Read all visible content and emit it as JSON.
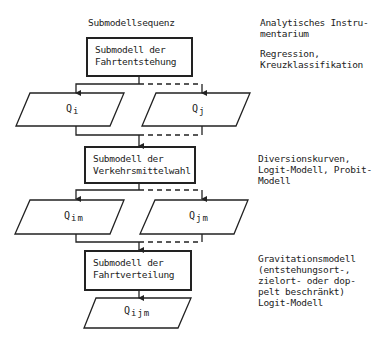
{
  "headers": {
    "left": "Submodellsequenz",
    "right": "Analytisches Instru-\nmentarium"
  },
  "submodels": [
    {
      "label": "Submodell der\nFahrtentstehung",
      "method": "Regression,\nKreuzklassifikation"
    },
    {
      "label": "Submodell der\nVerkehrsmittelwahl",
      "method": "Diversionskurven,\nLogit-Modell, Probit-\nModell"
    },
    {
      "label": "Submodell der\nFahrtverteilung",
      "method": "Gravitationsmodell\n(entstehungsort-,\nzielort- oder dop-\npelt beschränkt)\nLogit-Modell"
    }
  ],
  "outputs": {
    "qi": {
      "base": "Q",
      "sub": "i"
    },
    "qj": {
      "base": "Q",
      "sub": "j"
    },
    "qim": {
      "base": "Q",
      "sub": "im"
    },
    "qjm": {
      "base": "Q",
      "sub": "jm"
    },
    "qijm": {
      "base": "Q",
      "sub": "ijm"
    }
  }
}
